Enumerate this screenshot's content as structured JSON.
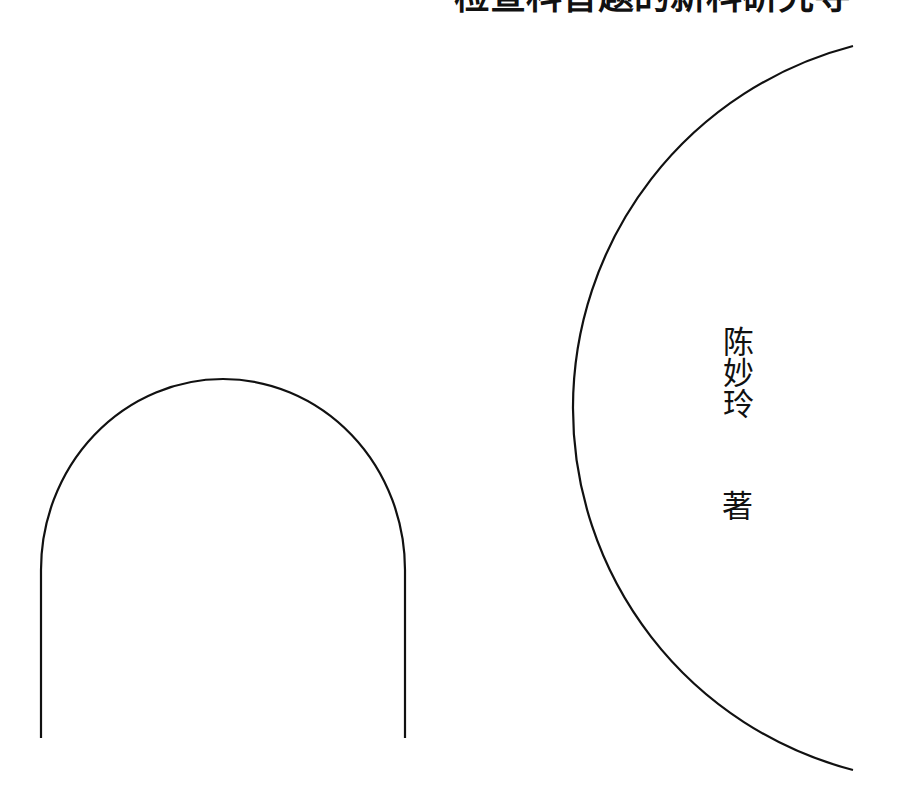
{
  "cover": {
    "title_partial": "检查科普题的新科研究寻",
    "author": "陈妙玲",
    "author_role": "著"
  },
  "colors": {
    "background": "#ffffff",
    "line": "#111111",
    "text": "#111111"
  },
  "shapes": [
    {
      "type": "arch",
      "left_x": 41,
      "right_x": 405,
      "top_y": 379,
      "spring_y": 570,
      "bottom_y": 738
    },
    {
      "type": "arc",
      "start": [
        853,
        46
      ],
      "end": [
        853,
        770
      ],
      "leftmost": [
        573,
        408
      ]
    }
  ]
}
